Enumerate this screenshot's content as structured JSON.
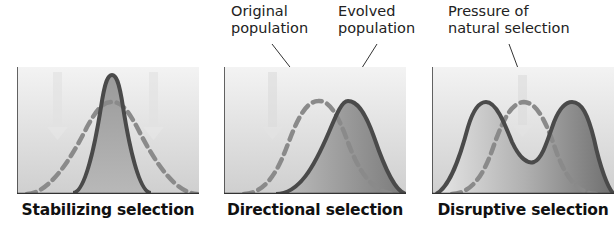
{
  "annotations": {
    "original": {
      "line1": "Original",
      "line2": "population"
    },
    "evolved": {
      "line1": "Evolved",
      "line2": "population"
    },
    "pressure": {
      "line1": "Pressure of",
      "line2": "natural selection"
    }
  },
  "panels": [
    {
      "caption": "Stabilizing selection"
    },
    {
      "caption": "Directional selection"
    },
    {
      "caption": "Disruptive selection"
    }
  ],
  "colors": {
    "curve": "#4a4a4a",
    "dashed": "#8a8a8a",
    "background_top": "#f2f2f2",
    "background_bottom": "#c8c8c8",
    "fill": "#7a7a7a"
  }
}
